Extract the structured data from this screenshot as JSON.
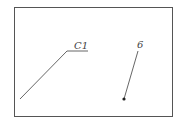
{
  "diagram": {
    "frame": {
      "x": 14,
      "y": 7,
      "width": 159,
      "height": 110,
      "stroke": "#555555"
    },
    "labels": [
      {
        "id": "c1",
        "text": "C1"
      },
      {
        "id": "six",
        "text": "6"
      }
    ],
    "leaders": [
      {
        "id": "c1-leader",
        "points": [
          [
            20,
            99
          ],
          [
            67,
            51
          ],
          [
            88,
            51
          ]
        ],
        "end_marker": "none"
      },
      {
        "id": "six-leader",
        "points": [
          [
            138,
            51
          ],
          [
            124,
            99
          ]
        ],
        "end_marker": "dot"
      }
    ],
    "line_color": "#555555"
  }
}
